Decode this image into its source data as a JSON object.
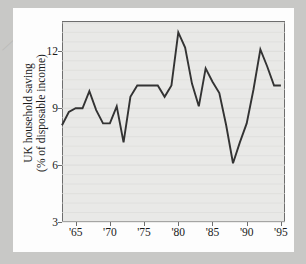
{
  "page": {
    "margin_mark": "⟋"
  },
  "chart_data": {
    "type": "line",
    "title": "",
    "subtitle": "",
    "xlabel": "",
    "ylabel": "UK household saving\n(% of disposable income)",
    "ylabel_lines": [
      "UK household saving",
      "(% of disposable income)"
    ],
    "ylim": [
      3,
      13.6
    ],
    "xlim": [
      1963,
      1995.6
    ],
    "yticks": [
      3,
      6,
      9,
      12
    ],
    "ytick_labels": [
      "3",
      "6",
      "9",
      "12"
    ],
    "xticks": [
      1965,
      1970,
      1975,
      1980,
      1985,
      1990,
      1995
    ],
    "xtick_labels": [
      "'65",
      "'70",
      "'75",
      "'80",
      "'85",
      "'90",
      "'95"
    ],
    "grid": true,
    "grid_axis": "y",
    "legend": false,
    "legend_position": "none",
    "line_color": "#333333",
    "panel_color": "#e9e9e7",
    "x": [
      1963,
      1964,
      1965,
      1966,
      1967,
      1968,
      1969,
      1970,
      1971,
      1972,
      1973,
      1974,
      1975,
      1976,
      1977,
      1978,
      1979,
      1980,
      1981,
      1982,
      1983,
      1984,
      1985,
      1986,
      1987,
      1988,
      1989,
      1990,
      1991,
      1992,
      1993,
      1994,
      1995
    ],
    "values": [
      8.1,
      8.8,
      9.0,
      9.0,
      9.9,
      8.9,
      8.2,
      8.2,
      9.1,
      7.2,
      9.6,
      10.2,
      10.2,
      10.2,
      10.2,
      9.6,
      10.2,
      13.0,
      12.2,
      10.3,
      9.1,
      11.1,
      10.4,
      9.8,
      8.1,
      6.1,
      7.2,
      8.2,
      10.0,
      12.1,
      11.2,
      10.2,
      10.2
    ],
    "series": [
      {
        "name": "UK household saving ratio",
        "values": [
          8.1,
          8.8,
          9.0,
          9.0,
          9.9,
          8.9,
          8.2,
          8.2,
          9.1,
          7.2,
          9.6,
          10.2,
          10.2,
          10.2,
          10.2,
          9.6,
          10.2,
          13.0,
          12.2,
          10.3,
          9.1,
          11.1,
          10.4,
          9.8,
          8.1,
          6.1,
          7.2,
          8.2,
          10.0,
          12.1,
          11.2,
          10.2,
          10.2
        ]
      }
    ]
  }
}
